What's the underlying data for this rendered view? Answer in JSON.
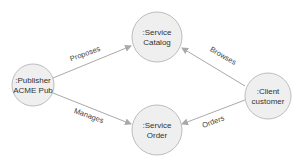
{
  "diagram": {
    "nodes": [
      {
        "id": "publisher",
        "line1": ":Publisher",
        "line2": "ACME Pub"
      },
      {
        "id": "catalog",
        "line1": ":Service",
        "line2": "Catalog"
      },
      {
        "id": "order",
        "line1": ":Service",
        "line2": "Order"
      },
      {
        "id": "client",
        "line1": ":Client",
        "line2": "customer"
      }
    ],
    "edges": [
      {
        "from": "publisher",
        "to": "catalog",
        "label": "Proposes"
      },
      {
        "from": "publisher",
        "to": "order",
        "label": "Manages"
      },
      {
        "from": "client",
        "to": "catalog",
        "label": "Browses"
      },
      {
        "from": "client",
        "to": "order",
        "label": "Orders"
      }
    ],
    "colors": {
      "node_fill": "#efefef",
      "node_stroke": "#bdbdbd",
      "edge": "#a9a9a9",
      "text": "#333333"
    }
  }
}
